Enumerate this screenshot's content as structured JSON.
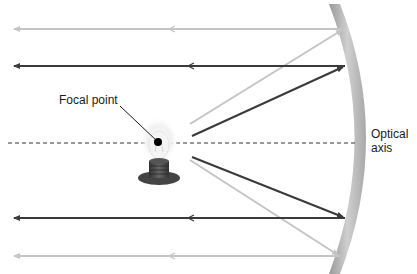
{
  "diagram": {
    "type": "optics-parabolic-reflector",
    "labels": {
      "focal_point": "Focal point",
      "optical_axis_line1": "Optical",
      "optical_axis_line2": "axis"
    },
    "colors": {
      "dark_ray": "#3a3a3a",
      "light_ray": "#c4c4c4",
      "mirror": "#b5b5b5",
      "axis": "#333333",
      "focal_dot": "#000000"
    },
    "rays": [
      {
        "name": "top-light",
        "shade": "light",
        "incident": [
          [
            190,
            124
          ],
          [
            344,
            29
          ]
        ],
        "reflected": [
          [
            344,
            29
          ],
          [
            12,
            29
          ]
        ]
      },
      {
        "name": "top-dark",
        "shade": "dark",
        "incident": [
          [
            192,
            136
          ],
          [
            345,
            66
          ]
        ],
        "reflected": [
          [
            345,
            66
          ],
          [
            12,
            66
          ]
        ]
      },
      {
        "name": "bottom-dark",
        "shade": "dark",
        "incident": [
          [
            192,
            157
          ],
          [
            345,
            218
          ]
        ],
        "reflected": [
          [
            345,
            218
          ],
          [
            12,
            218
          ]
        ]
      },
      {
        "name": "bottom-light",
        "shade": "light",
        "incident": [
          [
            190,
            160
          ],
          [
            340,
            256
          ]
        ],
        "reflected": [
          [
            340,
            256
          ],
          [
            12,
            256
          ]
        ]
      }
    ]
  }
}
